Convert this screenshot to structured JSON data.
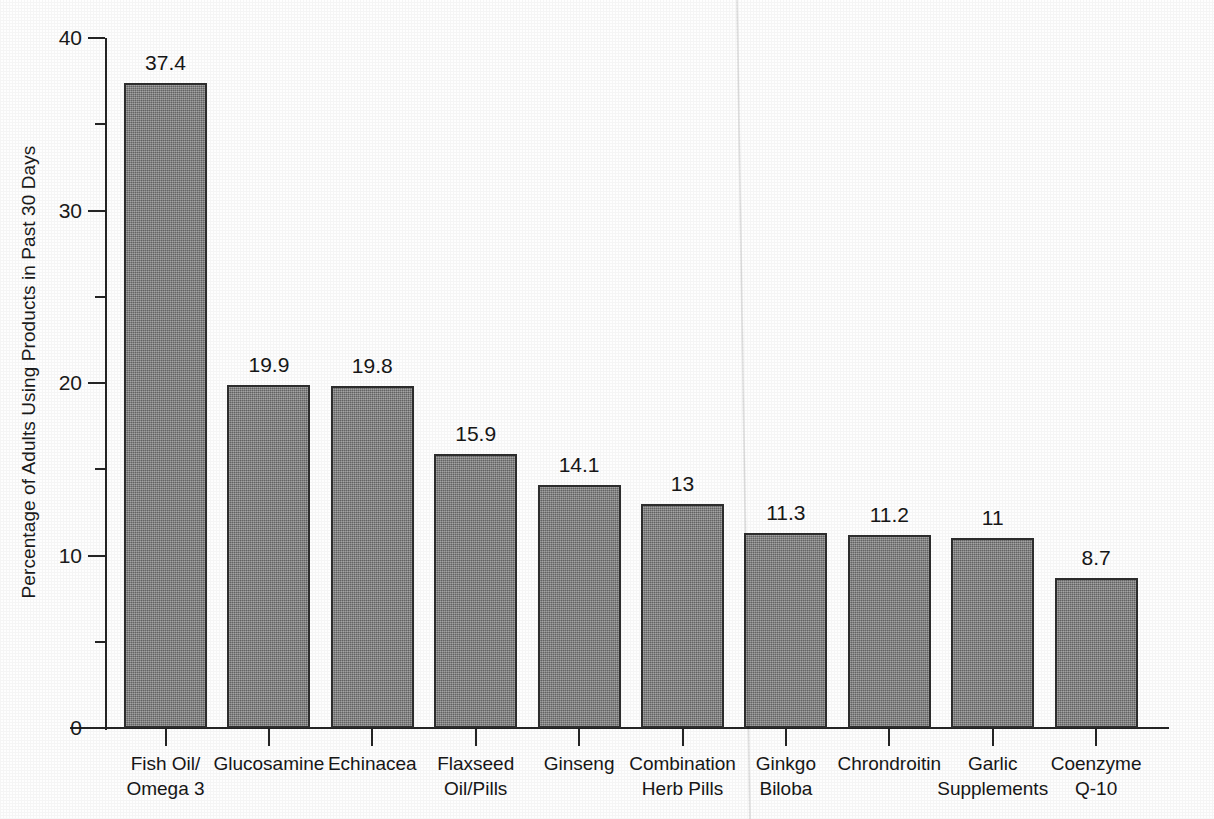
{
  "chart_data": {
    "type": "bar",
    "title": "",
    "xlabel": "",
    "ylabel": "Percentage of Adults Using Products in Past 30 Days",
    "ylim": [
      0,
      40
    ],
    "y_major_ticks": [
      0,
      10,
      20,
      30,
      40
    ],
    "y_major_tick_labels": [
      "0",
      "10",
      "20",
      "30",
      "40"
    ],
    "y_minor_ticks": [
      5,
      15,
      25,
      35
    ],
    "grid": false,
    "legend": null,
    "orientation": "vertical",
    "bar_color": "#7e7e7e",
    "bar_edge_color": "#2e2e2e",
    "categories": [
      "Fish Oil/ Omega 3",
      "Glucosamine",
      "Echinacea",
      "Flaxseed Oil/Pills",
      "Ginseng",
      "Combination Herb Pills",
      "Ginkgo Biloba",
      "Chrondroitin",
      "Garlic Supplements",
      "Coenzyme Q-10"
    ],
    "category_lines": [
      [
        "Fish Oil/",
        "Omega 3"
      ],
      [
        "Glucosamine"
      ],
      [
        "Echinacea"
      ],
      [
        "Flaxseed",
        "Oil/Pills"
      ],
      [
        "Ginseng"
      ],
      [
        "Combination",
        "Herb Pills"
      ],
      [
        "Ginkgo",
        "Biloba"
      ],
      [
        "Chrondroitin"
      ],
      [
        "Garlic",
        "Supplements"
      ],
      [
        "Coenzyme",
        "Q-10"
      ]
    ],
    "values": [
      37.4,
      19.9,
      19.8,
      15.9,
      14.1,
      13,
      11.3,
      11.2,
      11,
      8.7
    ],
    "value_labels": [
      "37.4",
      "19.9",
      "19.8",
      "15.9",
      "14.1",
      "13",
      "11.3",
      "11.2",
      "11",
      "8.7"
    ]
  }
}
